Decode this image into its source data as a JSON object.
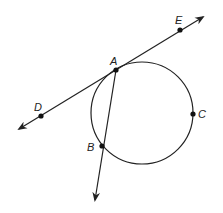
{
  "diagram": {
    "points": [
      {
        "id": "A",
        "label": "A",
        "on": "circle, tangent line, secant"
      },
      {
        "id": "B",
        "label": "B",
        "on": "circle, secant"
      },
      {
        "id": "C",
        "label": "C",
        "on": "circle"
      },
      {
        "id": "D",
        "label": "D",
        "on": "tangent line"
      },
      {
        "id": "E",
        "label": "E",
        "on": "tangent line"
      }
    ],
    "lines": [
      {
        "id": "tangent",
        "name": "line DE",
        "through": [
          "D",
          "A",
          "E"
        ],
        "arrows": "both"
      },
      {
        "id": "secant",
        "name": "ray AB",
        "through": [
          "A",
          "B"
        ],
        "arrows": "end"
      }
    ],
    "circle": {
      "name": "circle",
      "through": [
        "A",
        "B",
        "C"
      ]
    },
    "colors": {
      "stroke": "#222222",
      "background": "#ffffff"
    }
  }
}
